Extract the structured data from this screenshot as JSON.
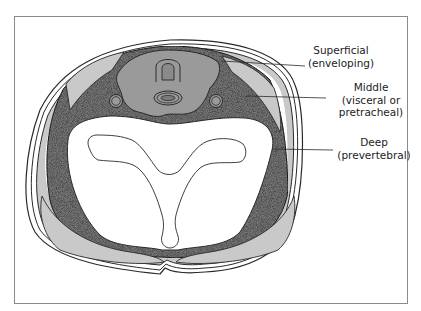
{
  "figure": {
    "colors": {
      "frame": "#8a8a8a",
      "outline": "#2a2a2a",
      "dark_stipple": "#7d7d7d",
      "visceral_fill": "#9a9a9a",
      "light_muscle": "#c9c9c9",
      "white": "#ffffff"
    }
  },
  "labels": {
    "superficial": {
      "line1": "Superficial",
      "line2": "(enveloping)"
    },
    "middle": {
      "line1": "Middle",
      "line2": "(visceral or",
      "line3": "pretracheal)"
    },
    "deep": {
      "line1": "Deep",
      "line2": "(prevertebral)"
    }
  }
}
